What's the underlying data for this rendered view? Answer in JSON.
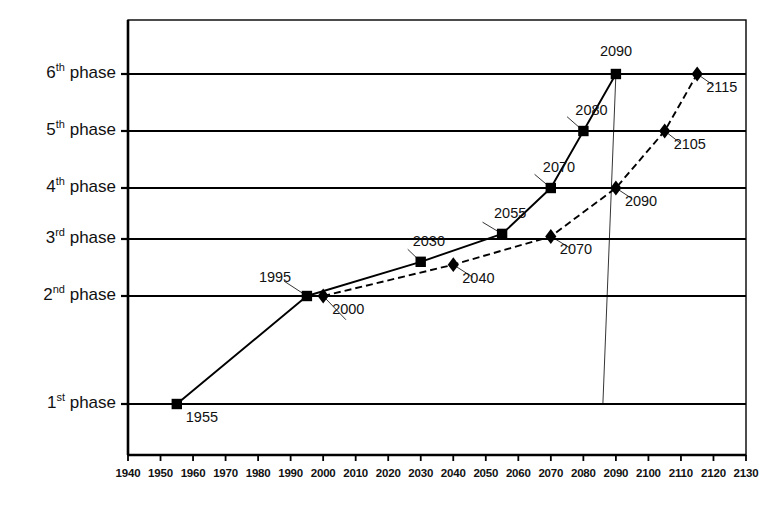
{
  "chart_data": {
    "type": "line",
    "title": "",
    "subtitle": "",
    "xlabel": "",
    "ylabel": "",
    "xlim": [
      1940,
      2130
    ],
    "ylim": [
      0.35,
      6.6
    ],
    "grid": true,
    "legend_position": "none",
    "x_ticks": [
      1940,
      1950,
      1960,
      1970,
      1980,
      1990,
      2000,
      2010,
      2020,
      2030,
      2040,
      2050,
      2060,
      2070,
      2080,
      2090,
      2100,
      2110,
      2120,
      2130
    ],
    "y_ticks": [
      1,
      2,
      3,
      4,
      5,
      6
    ],
    "y_tick_labels": [
      "1st phase",
      "2nd phase",
      "3rd phase",
      "4th phase",
      "5th phase",
      "6th phase"
    ],
    "y_tick_ordinals": [
      {
        "num": "1",
        "suffix": "st",
        "word": "phase"
      },
      {
        "num": "2",
        "suffix": "nd",
        "word": "phase"
      },
      {
        "num": "3",
        "suffix": "rd",
        "word": "phase"
      },
      {
        "num": "4",
        "suffix": "th",
        "word": "phase"
      },
      {
        "num": "5",
        "suffix": "th",
        "word": "phase"
      },
      {
        "num": "6",
        "suffix": "th",
        "word": "phase"
      }
    ],
    "series": [
      {
        "name": "square-series",
        "marker": "square",
        "line_style": "solid",
        "color": "#000000",
        "x": [
          1955,
          1995,
          2030,
          2055,
          2070,
          2080,
          2090
        ],
        "y": [
          1,
          2,
          2.6,
          3.1,
          4,
          5,
          6
        ],
        "labels": [
          "1955",
          "1995",
          "2030",
          "2055",
          "2070",
          "2080",
          "2090"
        ]
      },
      {
        "name": "diamond-series",
        "marker": "diamond",
        "line_style": "dashed",
        "color": "#000000",
        "x": [
          2000,
          2040,
          2070,
          2090,
          2105,
          2115
        ],
        "y": [
          2,
          2.55,
          3.05,
          4,
          5,
          6
        ],
        "labels": [
          "2000",
          "2040",
          "2070",
          "2090",
          "2105",
          "2115"
        ]
      }
    ],
    "point_labels": [
      {
        "text": "1955",
        "x": 1955,
        "y": 1,
        "series": "square-series",
        "place": "below-right"
      },
      {
        "text": "1995",
        "x": 1995,
        "y": 2,
        "series": "square-series",
        "place": "above-left"
      },
      {
        "text": "2000",
        "x": 2000,
        "y": 2,
        "series": "diamond-series",
        "place": "below-right"
      },
      {
        "text": "2030",
        "x": 2030,
        "y": 2.6,
        "series": "square-series",
        "place": "above-right"
      },
      {
        "text": "2040",
        "x": 2040,
        "y": 2.55,
        "series": "diamond-series",
        "place": "below-right"
      },
      {
        "text": "2055",
        "x": 2055,
        "y": 3.1,
        "series": "square-series",
        "place": "above-right"
      },
      {
        "text": "2070",
        "x": 2070,
        "y": 3.05,
        "series": "diamond-series",
        "place": "below-right"
      },
      {
        "text": "2070",
        "x": 2070,
        "y": 4,
        "series": "square-series",
        "place": "above-right"
      },
      {
        "text": "2090",
        "x": 2090,
        "y": 4,
        "series": "diamond-series",
        "place": "below-right"
      },
      {
        "text": "2080",
        "x": 2080,
        "y": 5,
        "series": "square-series",
        "place": "above-right"
      },
      {
        "text": "2105",
        "x": 2105,
        "y": 5,
        "series": "diamond-series",
        "place": "below-right"
      },
      {
        "text": "2090",
        "x": 2090,
        "y": 6,
        "series": "square-series",
        "place": "above-center"
      },
      {
        "text": "2115",
        "x": 2115,
        "y": 6,
        "series": "diamond-series",
        "place": "below-right"
      }
    ]
  },
  "axis_ticks": {
    "labels": [
      "1940",
      "1950",
      "1960",
      "1970",
      "1980",
      "1990",
      "2000",
      "2010",
      "2020",
      "2030",
      "2040",
      "2050",
      "2060",
      "2070",
      "2080",
      "2090",
      "2100",
      "2110",
      "2120",
      "2130"
    ]
  },
  "style": {
    "axis_color": "#000000",
    "grid_color": "#000000",
    "background": "#ffffff"
  }
}
